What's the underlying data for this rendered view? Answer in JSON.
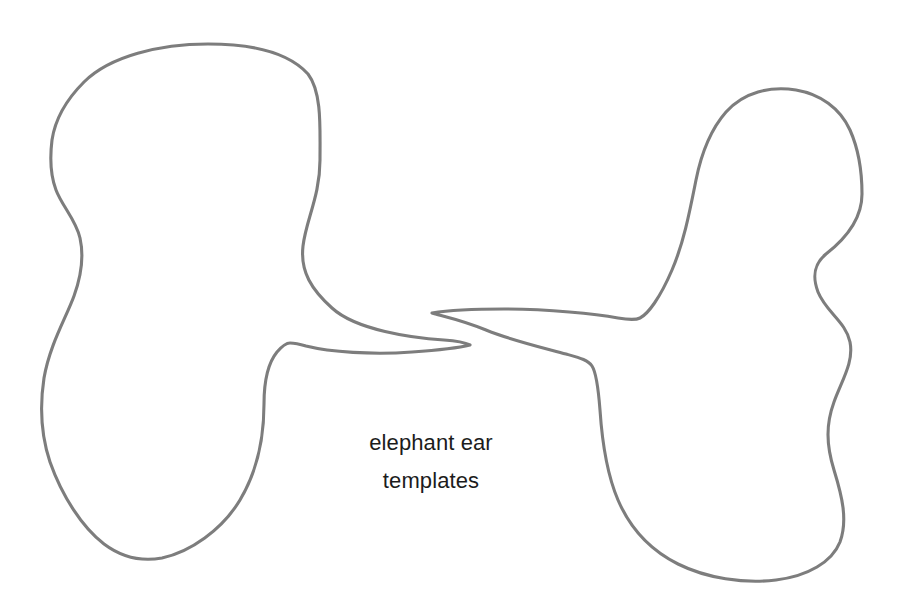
{
  "document": {
    "title": "elephant ear templates",
    "background_color": "#ffffff",
    "width": 904,
    "height": 601
  },
  "caption": {
    "line1": "elephant ear",
    "line2": "templates",
    "text_color": "#1c1c1c",
    "font_size_px": 22,
    "align": "center"
  },
  "artwork": {
    "description": "Two hand-drawn closed outline shapes (elephant ear sewing/craft templates), left and right, each with a pointed tapered tip; the two tips nearly touch and interlock near the center of the page.",
    "stroke_color": "#7d7d7d",
    "stroke_width_px": 3,
    "fill": "none",
    "shapes": [
      {
        "name": "left-ear-template",
        "bounds": {
          "x": 40,
          "y": 43,
          "width": 432,
          "height": 521
        },
        "tip": {
          "x": 470,
          "y": 345,
          "direction": "right"
        },
        "path": "M 208,44 C 252,44 288,52 308,74 C 322,92 320,128 320,160 C 320,196 306,220 303,246 C 300,272 312,290 332,308 C 356,330 412,338 444,340 C 458,341 466,343 470,345 C 462,347 440,350 412,352 C 372,355 330,352 306,346 C 296,343 292,343 290,343 C 288,343 283,345 277,352 C 268,363 264,382 264,404 C 264,436 258,470 240,500 C 222,530 190,552 162,558 C 140,562 120,556 104,544 C 82,527 62,496 50,462 C 40,432 40,404 44,378 C 50,344 66,318 74,296 C 82,274 84,256 80,238 C 76,220 62,206 56,190 C 50,174 50,156 52,140 C 55,120 66,100 84,82 C 110,56 160,44 208,44 Z"
      },
      {
        "name": "right-ear-template",
        "bounds": {
          "x": 432,
          "y": 87,
          "width": 432,
          "height": 494
        },
        "tip": {
          "x": 432,
          "y": 313,
          "direction": "left"
        },
        "path": "M 432,313 C 444,311 470,309 504,309 C 548,309 596,314 618,318 C 630,320 636,320 640,318 C 648,314 660,298 672,270 C 684,242 690,210 696,180 C 702,150 712,128 726,112 C 744,92 770,86 796,90 C 820,94 840,108 850,130 C 858,148 862,172 862,194 C 862,220 844,240 826,254 C 814,264 812,276 818,292 C 826,312 846,322 850,342 C 854,362 842,380 834,402 C 826,424 826,444 834,470 C 842,496 848,520 840,542 C 832,562 808,576 776,580 C 744,584 706,578 678,564 C 650,550 630,528 618,500 C 606,472 602,440 600,410 C 598,384 596,372 592,366 C 588,360 580,358 566,354 C 544,348 510,340 486,330 C 462,320 442,316 432,313 Z"
      }
    ]
  }
}
